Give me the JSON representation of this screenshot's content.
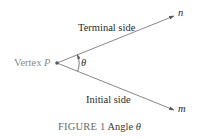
{
  "figure": {
    "vertex_label": "Vertex ",
    "vertex_symbol": "P",
    "terminal_side_label": "Terminal side",
    "initial_side_label": "Initial side",
    "terminal_point_label": "n",
    "initial_point_label": "m",
    "angle_symbol": "θ",
    "caption_number": "FIGURE 1",
    "caption_text": " Angle ",
    "caption_symbol": "θ"
  },
  "colors": {
    "line": "#7a7a7a",
    "text": "#2b2b2b",
    "vertex_text": "#8a8a8a",
    "background": "#ffffff"
  },
  "geometry": {
    "vertex": [
      57,
      63
    ],
    "terminal_end": [
      174,
      16
    ],
    "initial_end": [
      174,
      110
    ]
  }
}
